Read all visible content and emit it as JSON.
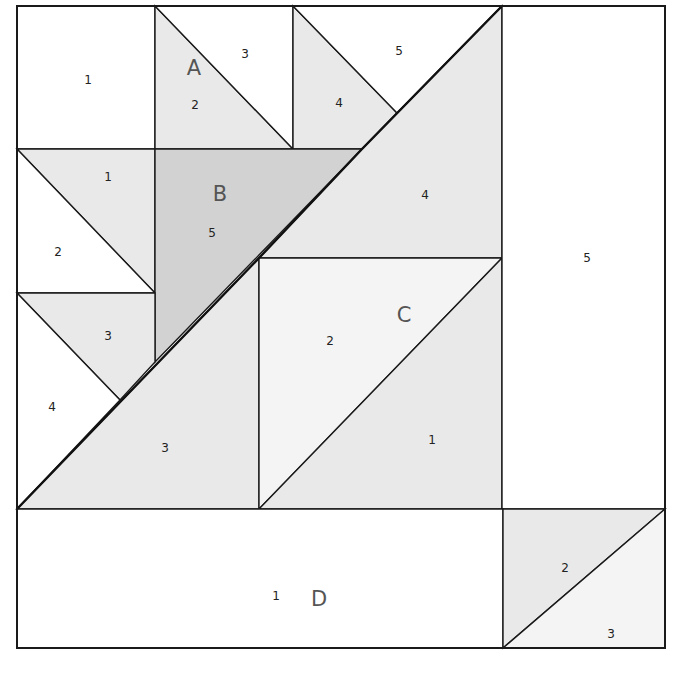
{
  "colors": {
    "white": "#ffffff",
    "light": "#e9e9e9",
    "lighter": "#f4f4f4",
    "medium": "#d2d2d2",
    "line": "#1a1a1a"
  },
  "border": {
    "x": 17,
    "y": 6,
    "w": 648,
    "h": 642
  },
  "sections": [
    {
      "label": "A",
      "x": 194,
      "y": 69
    },
    {
      "label": "B",
      "x": 220,
      "y": 195
    },
    {
      "label": "C",
      "x": 404,
      "y": 316
    },
    {
      "label": "D",
      "x": 319,
      "y": 600
    }
  ],
  "pieces": [
    {
      "section": "",
      "num": "1",
      "fill": "white",
      "points": "17,6 155,6 155,149 17,149",
      "lx": 88,
      "ly": 80
    },
    {
      "section": "A",
      "num": "2",
      "fill": "light",
      "points": "155,6 293,149 155,149",
      "lx": 195,
      "ly": 105
    },
    {
      "section": "A",
      "num": "3",
      "fill": "white",
      "points": "155,6 293,6 293,149",
      "lx": 245,
      "ly": 54
    },
    {
      "section": "A",
      "num": "4",
      "fill": "light",
      "points": "293,6 397,113 362,149 293,149",
      "lx": 339,
      "ly": 103
    },
    {
      "section": "A",
      "num": "5",
      "fill": "white",
      "points": "293,6 502,6 397,113",
      "lx": 399,
      "ly": 51
    },
    {
      "section": "",
      "num": "1",
      "fill": "light",
      "points": "17,149 155,149 155,293",
      "lx": 108,
      "ly": 177
    },
    {
      "section": "",
      "num": "2",
      "fill": "white",
      "points": "17,149 155,293 17,293",
      "lx": 58,
      "ly": 252
    },
    {
      "section": "B",
      "num": "5",
      "fill": "medium",
      "points": "155,149 362,149 155,362",
      "lx": 212,
      "ly": 233
    },
    {
      "section": "",
      "num": "4",
      "fill": "light",
      "points": "362,149 502,6 502,258 259,258",
      "lx": 425,
      "ly": 195
    },
    {
      "section": "",
      "num": "3",
      "fill": "light",
      "points": "17,293 155,293 155,362 120,400",
      "lx": 108,
      "ly": 336
    },
    {
      "section": "",
      "num": "4",
      "fill": "white",
      "points": "17,293 120,400 17,509",
      "lx": 52,
      "ly": 407
    },
    {
      "section": "",
      "num": "3",
      "fill": "light",
      "points": "17,509 259,258 259,509",
      "lx": 165,
      "ly": 448
    },
    {
      "section": "C",
      "num": "2",
      "fill": "lighter",
      "points": "259,258 502,258 259,509",
      "lx": 330,
      "ly": 341
    },
    {
      "section": "C",
      "num": "1",
      "fill": "light",
      "points": "502,258 502,509 259,509",
      "lx": 432,
      "ly": 440
    },
    {
      "section": "",
      "num": "5",
      "fill": "white",
      "points": "502,6 665,6 665,509 502,509",
      "lx": 587,
      "ly": 258
    },
    {
      "section": "D",
      "num": "1",
      "fill": "white",
      "points": "17,509 503,509 503,648 17,648",
      "lx": 276,
      "ly": 596
    },
    {
      "section": "",
      "num": "2",
      "fill": "light",
      "points": "503,509 665,509 503,648",
      "lx": 565,
      "ly": 568
    },
    {
      "section": "",
      "num": "3",
      "fill": "lighter",
      "points": "665,509 665,648 503,648",
      "lx": 611,
      "ly": 634
    }
  ],
  "thick_lines": [
    {
      "points": "17,509 259,258 362,149 502,6"
    }
  ]
}
